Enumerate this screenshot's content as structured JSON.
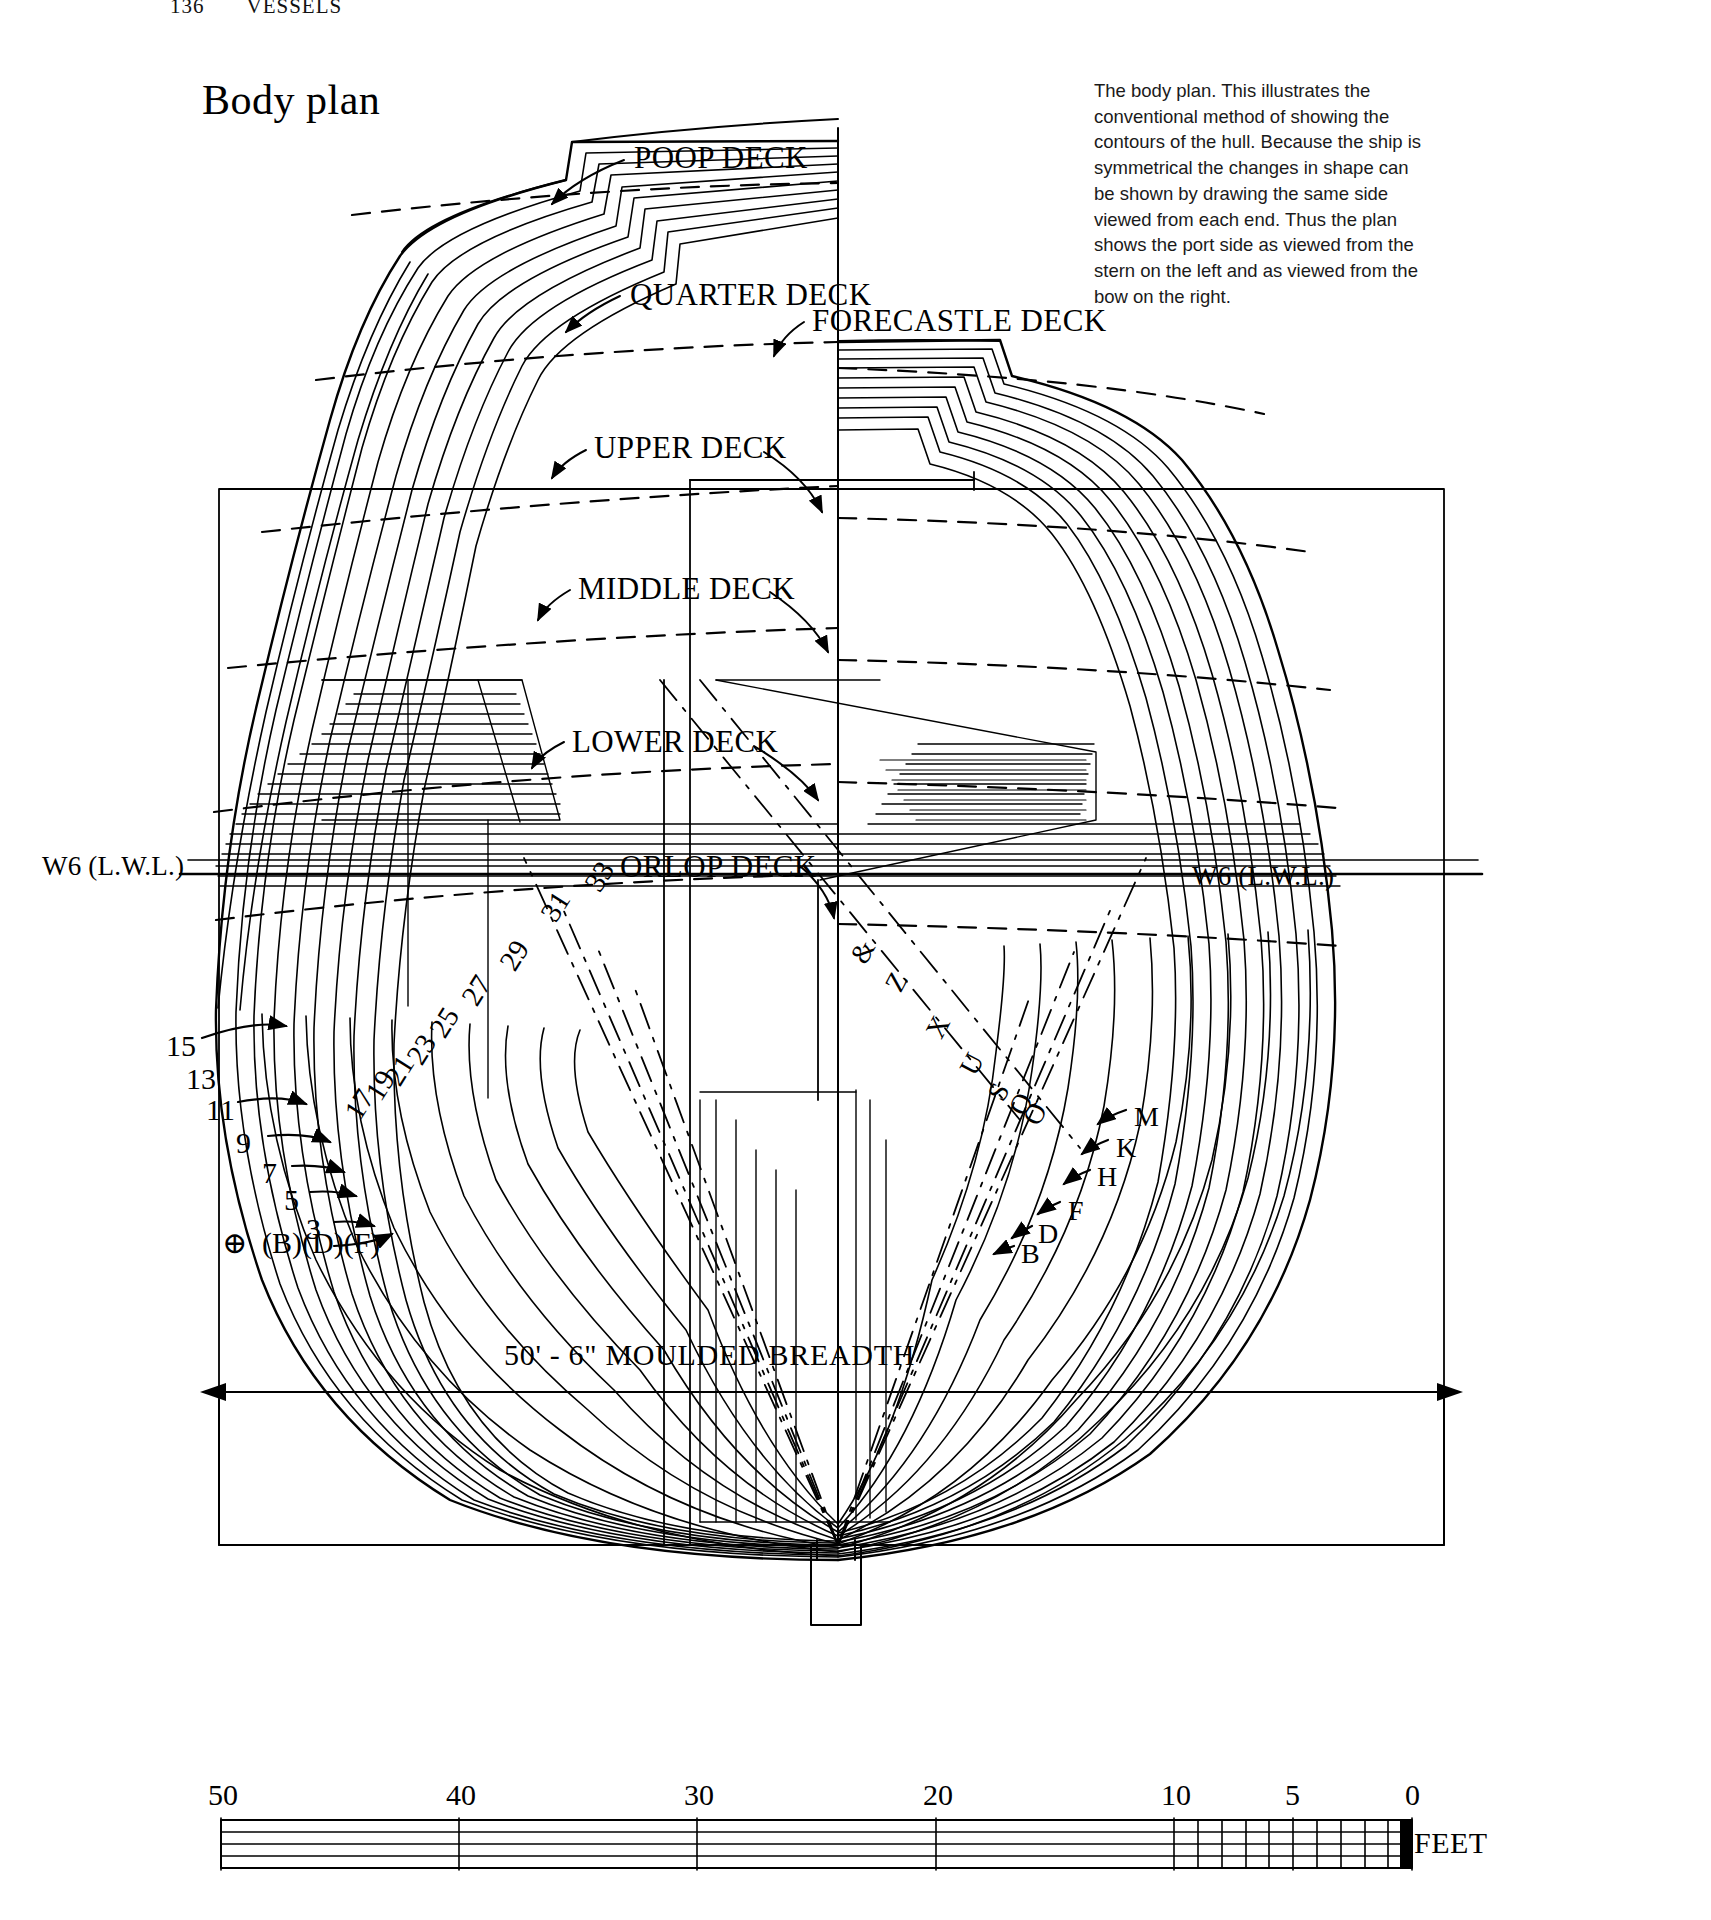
{
  "page": {
    "folio": "136",
    "running_head": "VESSELS"
  },
  "title": "Body plan",
  "caption": "The body plan. This illustrates the conventional method of showing the contours of the hull. Because the ship is symmetrical the changes in shape can be shown by drawing the same side viewed from each end. Thus the plan shows the port side as viewed from the stern on the left and as viewed from the bow on the right.",
  "deck_labels": [
    {
      "id": "poop-deck",
      "text": "POOP DECK",
      "x": 634,
      "y": 142
    },
    {
      "id": "quarter-deck",
      "text": "QUARTER DECK",
      "x": 630,
      "y": 279
    },
    {
      "id": "forecastle-deck",
      "text": "FORECASTLE DECK",
      "x": 812,
      "y": 305
    },
    {
      "id": "upper-deck",
      "text": "UPPER DECK",
      "x": 594,
      "y": 432
    },
    {
      "id": "middle-deck",
      "text": "MIDDLE DECK",
      "x": 578,
      "y": 573
    },
    {
      "id": "lower-deck",
      "text": "LOWER DECK",
      "x": 572,
      "y": 726
    },
    {
      "id": "orlop-deck",
      "text": "ORLOP DECK",
      "x": 620,
      "y": 851
    }
  ],
  "waterline_labels": [
    {
      "id": "wl-left",
      "text": "W6 (L.W.L.)",
      "x": 42,
      "y": 853
    },
    {
      "id": "wl-right",
      "text": "W6 (L.W.L.)",
      "x": 1192,
      "y": 863
    }
  ],
  "station_numbers_left": [
    {
      "text": "15",
      "x": 166,
      "y": 1031
    },
    {
      "text": "13",
      "x": 186,
      "y": 1064
    },
    {
      "text": "11",
      "x": 206,
      "y": 1095
    },
    {
      "text": "9",
      "x": 236,
      "y": 1128
    },
    {
      "text": "7",
      "x": 262,
      "y": 1158
    },
    {
      "text": "5",
      "x": 284,
      "y": 1185
    },
    {
      "text": "3",
      "x": 306,
      "y": 1214
    }
  ],
  "station_numbers_diagonal": [
    {
      "text": "33",
      "x": 585,
      "y": 862
    },
    {
      "text": "31",
      "x": 541,
      "y": 892
    },
    {
      "text": "29",
      "x": 500,
      "y": 941
    },
    {
      "text": "27",
      "x": 462,
      "y": 976
    },
    {
      "text": "25",
      "x": 430,
      "y": 1008
    },
    {
      "text": "23",
      "x": 407,
      "y": 1035
    },
    {
      "text": "21",
      "x": 385,
      "y": 1056
    },
    {
      "text": "19",
      "x": 366,
      "y": 1071
    },
    {
      "text": "17",
      "x": 345,
      "y": 1090
    }
  ],
  "midship_mark": {
    "text": "(B)(D)(F)",
    "symbol": "⊕",
    "x": 222,
    "y": 1230
  },
  "letter_labels_right": [
    {
      "text": "M",
      "x": 1134,
      "y": 1103
    },
    {
      "text": "K",
      "x": 1116,
      "y": 1134
    },
    {
      "text": "H",
      "x": 1097,
      "y": 1163
    },
    {
      "text": "F",
      "x": 1068,
      "y": 1197
    },
    {
      "text": "D",
      "x": 1038,
      "y": 1220
    },
    {
      "text": "B",
      "x": 1021,
      "y": 1240
    }
  ],
  "letter_labels_diagonal": [
    {
      "text": "&",
      "x": 852,
      "y": 938
    },
    {
      "text": "Z",
      "x": 888,
      "y": 968
    },
    {
      "text": "X",
      "x": 928,
      "y": 1013
    },
    {
      "text": "U",
      "x": 962,
      "y": 1050
    },
    {
      "text": "S",
      "x": 991,
      "y": 1078
    },
    {
      "text": "Q",
      "x": 1011,
      "y": 1090
    },
    {
      "text": "O",
      "x": 1025,
      "y": 1100
    }
  ],
  "breadth_dimension": {
    "text": "50' - 6\" MOULDED BREADTH",
    "x": 504,
    "y": 1340
  },
  "scale_bar": {
    "ticks": [
      {
        "label": "50",
        "feet": 50
      },
      {
        "label": "40",
        "feet": 40
      },
      {
        "label": "30",
        "feet": 30
      },
      {
        "label": "20",
        "feet": 20
      },
      {
        "label": "10",
        "feet": 10
      },
      {
        "label": "5",
        "feet": 5
      },
      {
        "label": "0",
        "feet": 0
      }
    ],
    "unit_label": "FEET",
    "min_feet": 0,
    "max_feet": 50
  },
  "colors": {
    "ink": "#000000",
    "paper": "#ffffff",
    "caption_ink": "#1a1a1a"
  }
}
